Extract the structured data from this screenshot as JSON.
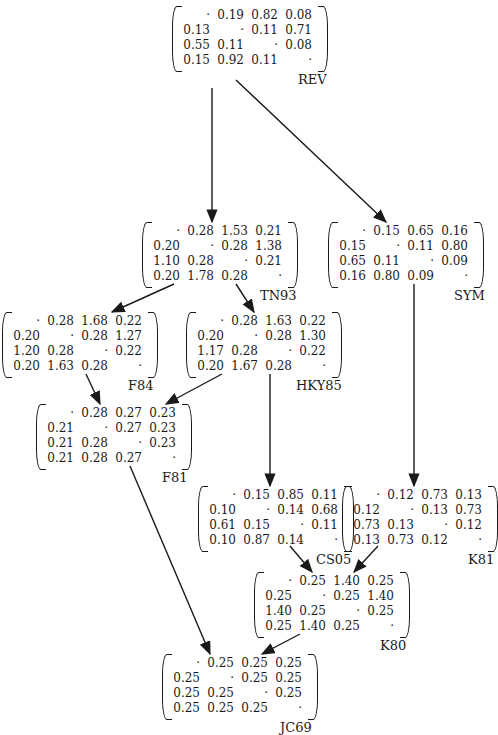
{
  "diagram": {
    "title": "",
    "nodes": [
      {
        "id": "REV",
        "label": "REV",
        "x": 172,
        "y": 8,
        "matrix": [
          [
            "·",
            "0.19",
            "0.82",
            "0.08"
          ],
          [
            "0.13",
            "·",
            "0.11",
            "0.71"
          ],
          [
            "0.55",
            "0.11",
            "·",
            "0.08"
          ],
          [
            "0.15",
            "0.92",
            "0.11",
            "·"
          ]
        ]
      },
      {
        "id": "TN93",
        "label": "TN93",
        "x": 142,
        "y": 224,
        "matrix": [
          [
            "·",
            "0.28",
            "1.53",
            "0.21"
          ],
          [
            "0.20",
            "·",
            "0.28",
            "1.38"
          ],
          [
            "1.10",
            "0.28",
            "·",
            "0.21"
          ],
          [
            "0.20",
            "1.78",
            "0.28",
            "·"
          ]
        ]
      },
      {
        "id": "SYM",
        "label": "SYM",
        "x": 328,
        "y": 224,
        "matrix": [
          [
            "·",
            "0.15",
            "0.65",
            "0.16"
          ],
          [
            "0.15",
            "·",
            "0.11",
            "0.80"
          ],
          [
            "0.65",
            "0.11",
            "·",
            "0.09"
          ],
          [
            "0.16",
            "0.80",
            "0.09",
            "·"
          ]
        ]
      },
      {
        "id": "F84",
        "label": "F84",
        "x": 2,
        "y": 314,
        "matrix": [
          [
            "·",
            "0.28",
            "1.68",
            "0.22"
          ],
          [
            "0.20",
            "·",
            "0.28",
            "1.27"
          ],
          [
            "1.20",
            "0.28",
            "·",
            "0.22"
          ],
          [
            "0.20",
            "1.63",
            "0.28",
            "·"
          ]
        ]
      },
      {
        "id": "HKY85",
        "label": "HKY85",
        "x": 186,
        "y": 314,
        "matrix": [
          [
            "·",
            "0.28",
            "1.63",
            "0.22"
          ],
          [
            "0.20",
            "·",
            "0.28",
            "1.30"
          ],
          [
            "1.17",
            "0.28",
            "·",
            "0.22"
          ],
          [
            "0.20",
            "1.67",
            "0.28",
            "·"
          ]
        ]
      },
      {
        "id": "F81",
        "label": "F81",
        "x": 36,
        "y": 406,
        "matrix": [
          [
            "·",
            "0.28",
            "0.27",
            "0.23"
          ],
          [
            "0.21",
            "·",
            "0.27",
            "0.23"
          ],
          [
            "0.21",
            "0.28",
            "·",
            "0.23"
          ],
          [
            "0.21",
            "0.28",
            "0.27",
            "·"
          ]
        ]
      },
      {
        "id": "CS05",
        "label": "CS05",
        "x": 198,
        "y": 488,
        "matrix": [
          [
            "·",
            "0.15",
            "0.85",
            "0.11"
          ],
          [
            "0.10",
            "·",
            "0.14",
            "0.68"
          ],
          [
            "0.61",
            "0.15",
            "·",
            "0.11"
          ],
          [
            "0.10",
            "0.87",
            "0.14",
            "·"
          ]
        ]
      },
      {
        "id": "K81",
        "label": "K81",
        "x": 342,
        "y": 488,
        "matrix": [
          [
            "·",
            "0.12",
            "0.73",
            "0.13"
          ],
          [
            "0.12",
            "·",
            "0.13",
            "0.73"
          ],
          [
            "0.73",
            "0.13",
            "·",
            "0.12"
          ],
          [
            "0.13",
            "0.73",
            "0.12",
            "·"
          ]
        ]
      },
      {
        "id": "K80",
        "label": "K80",
        "x": 254,
        "y": 574,
        "matrix": [
          [
            "·",
            "0.25",
            "1.40",
            "0.25"
          ],
          [
            "0.25",
            "·",
            "0.25",
            "1.40"
          ],
          [
            "1.40",
            "0.25",
            "·",
            "0.25"
          ],
          [
            "0.25",
            "1.40",
            "0.25",
            "·"
          ]
        ]
      },
      {
        "id": "JC69",
        "label": "JC69",
        "x": 162,
        "y": 656,
        "matrix": [
          [
            "·",
            "0.25",
            "0.25",
            "0.25"
          ],
          [
            "0.25",
            "·",
            "0.25",
            "0.25"
          ],
          [
            "0.25",
            "0.25",
            "·",
            "0.25"
          ],
          [
            "0.25",
            "0.25",
            "0.25",
            "·"
          ]
        ]
      }
    ],
    "edges": [
      {
        "from": "REV",
        "to": "TN93",
        "x1": 212,
        "y1": 88,
        "x2": 212,
        "y2": 222
      },
      {
        "from": "REV",
        "to": "SYM",
        "x1": 236,
        "y1": 80,
        "x2": 386,
        "y2": 222
      },
      {
        "from": "TN93",
        "to": "F84",
        "x1": 174,
        "y1": 284,
        "x2": 112,
        "y2": 312
      },
      {
        "from": "TN93",
        "to": "HKY85",
        "x1": 236,
        "y1": 284,
        "x2": 254,
        "y2": 312
      },
      {
        "from": "SYM",
        "to": "K81",
        "x1": 414,
        "y1": 284,
        "x2": 414,
        "y2": 486
      },
      {
        "from": "F84",
        "to": "F81",
        "x1": 86,
        "y1": 374,
        "x2": 100,
        "y2": 404
      },
      {
        "from": "HKY85",
        "to": "F81",
        "x1": 222,
        "y1": 374,
        "x2": 166,
        "y2": 404
      },
      {
        "from": "HKY85",
        "to": "CS05",
        "x1": 270,
        "y1": 374,
        "x2": 270,
        "y2": 486
      },
      {
        "from": "F81",
        "to": "JC69",
        "x1": 130,
        "y1": 466,
        "x2": 210,
        "y2": 654
      },
      {
        "from": "CS05",
        "to": "K80",
        "x1": 290,
        "y1": 546,
        "x2": 312,
        "y2": 572
      },
      {
        "from": "K81",
        "to": "K80",
        "x1": 378,
        "y1": 546,
        "x2": 354,
        "y2": 572
      },
      {
        "from": "K80",
        "to": "JC69",
        "x1": 300,
        "y1": 634,
        "x2": 262,
        "y2": 654
      }
    ]
  }
}
